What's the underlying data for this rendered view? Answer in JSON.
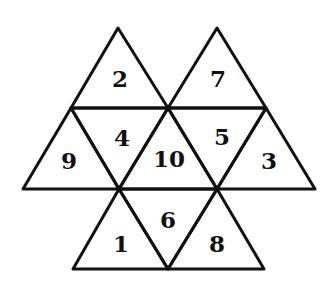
{
  "diagram": {
    "title": "",
    "triangles": [
      {
        "id": "t-top-left",
        "number": "2",
        "points": [
          [
            118,
            28
          ],
          [
            71,
            108
          ],
          [
            168,
            108
          ]
        ],
        "label_pos": [
          120,
          78
        ]
      },
      {
        "id": "t-top-right",
        "number": "7",
        "points": [
          [
            217,
            28
          ],
          [
            168,
            108
          ],
          [
            266,
            108
          ]
        ],
        "label_pos": [
          218,
          78
        ]
      },
      {
        "id": "t-mid-left",
        "number": "9",
        "points": [
          [
            71,
            108
          ],
          [
            23,
            189
          ],
          [
            119,
            189
          ]
        ],
        "label_pos": [
          69,
          160
        ]
      },
      {
        "id": "t-mid-left-inv",
        "number": "4",
        "points": [
          [
            71,
            108
          ],
          [
            168,
            108
          ],
          [
            119,
            189
          ]
        ],
        "label_pos": [
          122,
          137
        ]
      },
      {
        "id": "t-mid-center",
        "number": "10",
        "points": [
          [
            168,
            108
          ],
          [
            119,
            189
          ],
          [
            217,
            189
          ]
        ],
        "label_pos": [
          169,
          158
        ]
      },
      {
        "id": "t-mid-right-inv",
        "number": "5",
        "points": [
          [
            168,
            108
          ],
          [
            266,
            108
          ],
          [
            217,
            189
          ]
        ],
        "label_pos": [
          222,
          136
        ]
      },
      {
        "id": "t-mid-right",
        "number": "3",
        "points": [
          [
            266,
            108
          ],
          [
            217,
            189
          ],
          [
            315,
            189
          ]
        ],
        "label_pos": [
          269,
          160
        ]
      },
      {
        "id": "t-bot-left",
        "number": "1",
        "points": [
          [
            119,
            189
          ],
          [
            73,
            269
          ],
          [
            168,
            269
          ]
        ],
        "label_pos": [
          121,
          243
        ]
      },
      {
        "id": "t-bot-center-inv",
        "number": "6",
        "points": [
          [
            119,
            189
          ],
          [
            217,
            189
          ],
          [
            168,
            269
          ]
        ],
        "label_pos": [
          168,
          219
        ]
      },
      {
        "id": "t-bot-right",
        "number": "8",
        "points": [
          [
            217,
            189
          ],
          [
            168,
            269
          ],
          [
            264,
            269
          ]
        ],
        "label_pos": [
          217,
          243
        ]
      }
    ],
    "colors": {
      "stroke": "#111111",
      "background": "#ffffff",
      "text": "#111111"
    }
  }
}
